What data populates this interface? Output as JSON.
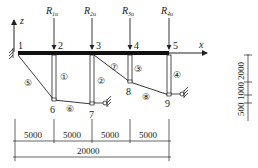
{
  "diagram": {
    "axes": {
      "x_label": "x",
      "z_label": "z"
    },
    "loads": [
      {
        "label": "R",
        "sub": "1u",
        "node": 2
      },
      {
        "label": "R",
        "sub": "2u",
        "node": 3
      },
      {
        "label": "R",
        "sub": "3u",
        "node": 4
      },
      {
        "label": "R",
        "sub": "4u",
        "node": 5
      }
    ],
    "nodes": [
      "1",
      "2",
      "3",
      "4",
      "5",
      "6",
      "7",
      "8",
      "9"
    ],
    "members": [
      "①",
      "②",
      "③",
      "④",
      "⑤",
      "⑥",
      "⑦",
      "⑧"
    ],
    "spans": [
      "5000",
      "5000",
      "5000",
      "5000"
    ],
    "total_span": "20000",
    "vertical_dims": [
      "2000",
      "1000",
      "500"
    ],
    "colors": {
      "line": "#222222",
      "beam": "#111111",
      "background": "#ffffff"
    }
  }
}
